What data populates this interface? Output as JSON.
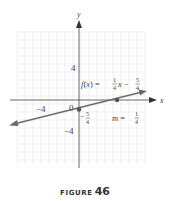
{
  "chart_data": {
    "type": "line",
    "title": "",
    "xlabel": "x",
    "ylabel": "y",
    "xlim": [
      -8,
      8
    ],
    "ylim": [
      -8,
      8
    ],
    "grid": true,
    "x_ticks": [
      {
        "value": -4,
        "label": "-4"
      },
      {
        "value": 0,
        "label": "0"
      }
    ],
    "y_ticks": [
      {
        "value": 4,
        "label": "4"
      },
      {
        "value": -4,
        "label": "-4"
      }
    ],
    "series": [
      {
        "name": "f(x) = 1/4 x - 5/4",
        "slope": 0.25,
        "intercept": -1.25,
        "x": [
          -7.5,
          7.5
        ],
        "y": [
          -3.125,
          0.625
        ],
        "marked_points": [
          [
            0,
            -1.25
          ],
          [
            5,
            0
          ]
        ]
      }
    ],
    "annotations": [
      {
        "text": "f(x) = 1/4 x - 5/4",
        "x": 0.3,
        "y": 1.6
      },
      {
        "text": "-5/4",
        "x": 0.2,
        "y": -2.0
      },
      {
        "text": "m = 1/4",
        "x": 4.2,
        "y": -2.0
      }
    ]
  },
  "labels": {
    "x_axis": "x",
    "y_axis": "y",
    "tick_x_neg4": "−4",
    "tick_origin": "0",
    "tick_y_4": "4",
    "tick_y_neg4": "−4",
    "function_label": {
      "f": "f",
      "open": "(",
      "var": "x",
      "close": ")",
      "eq": " = ",
      "num1": "1",
      "den1": "4",
      "x": "x",
      "minus": " − ",
      "num2": "5",
      "den2": "4"
    },
    "intercept_label": {
      "minus": "−",
      "num": "5",
      "den": "4"
    },
    "slope_label": {
      "m": "m",
      "eq": " = ",
      "num": "1",
      "den": "4"
    }
  },
  "caption": {
    "word": "FIGURE",
    "number": "46"
  },
  "colors": {
    "grid": "#e4e4e4",
    "axis": "#555555",
    "line": "#6a6a6a",
    "point": "#555555"
  }
}
